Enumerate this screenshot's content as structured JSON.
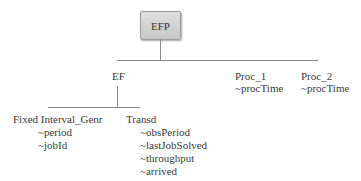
{
  "diagram": {
    "root": {
      "label": "EFP"
    },
    "children": [
      {
        "label": "EF",
        "attributes": [],
        "children": [
          {
            "label": "Fixed Interval_Genr",
            "attributes": [
              "~period",
              "~jobId"
            ]
          },
          {
            "label": "Transd",
            "attributes": [
              "~obsPeriod",
              "~lastJobSolved",
              "~throughput",
              "~arrived"
            ]
          }
        ]
      },
      {
        "label": "Proc_1",
        "attributes": [
          "~procTime"
        ]
      },
      {
        "label": "Proc_2",
        "attributes": [
          "~procTime"
        ]
      }
    ]
  }
}
